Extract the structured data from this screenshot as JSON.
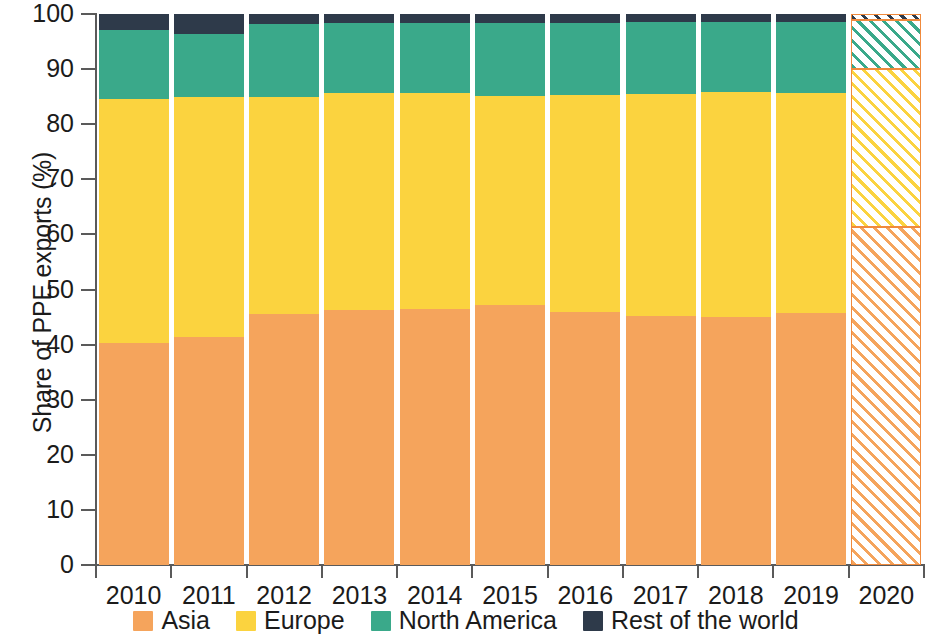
{
  "chart_data": {
    "type": "bar",
    "stacked": true,
    "title": "",
    "subtitle": "",
    "xlabel": "",
    "ylabel": "Share of PPE exports (%)",
    "ylim": [
      0,
      100
    ],
    "yticks": [
      0,
      10,
      20,
      30,
      40,
      50,
      60,
      70,
      80,
      90,
      100
    ],
    "ytick_labels": [
      "0",
      "10",
      "20",
      "30",
      "40",
      "50",
      "60",
      "70",
      "80",
      "90",
      "100"
    ],
    "grid": false,
    "legend_position": "bottom",
    "categories": [
      "2010",
      "2011",
      "2012",
      "2013",
      "2014",
      "2015",
      "2016",
      "2017",
      "2018",
      "2019",
      "2020"
    ],
    "hatched_categories": [
      "2020"
    ],
    "series": [
      {
        "name": "Asia",
        "color": "#f5a45c",
        "values": [
          40.3,
          41.3,
          45.6,
          46.2,
          46.4,
          47.2,
          46.0,
          45.2,
          45.0,
          45.8,
          61.4
        ]
      },
      {
        "name": "Europe",
        "color": "#fbd33f",
        "values": [
          44.3,
          43.6,
          39.3,
          39.4,
          39.3,
          38.0,
          39.3,
          40.2,
          40.9,
          39.9,
          28.7
        ]
      },
      {
        "name": "North America",
        "color": "#3aa98a",
        "values": [
          12.5,
          11.5,
          13.3,
          12.7,
          12.6,
          13.1,
          13.0,
          13.1,
          12.6,
          12.8,
          8.9
        ]
      },
      {
        "name": "Rest of the world",
        "color": "#2e3a4a",
        "values": [
          2.9,
          3.6,
          1.8,
          1.7,
          1.7,
          1.7,
          1.7,
          1.5,
          1.5,
          1.5,
          1.0
        ]
      }
    ],
    "annotations": []
  },
  "legend": {
    "items": [
      {
        "label": "Asia",
        "color": "#f5a45c"
      },
      {
        "label": "Europe",
        "color": "#fbd33f"
      },
      {
        "label": "North America",
        "color": "#3aa98a"
      },
      {
        "label": "Rest of the world",
        "color": "#2e3a4a"
      }
    ]
  },
  "axes": {
    "y_title": "Share of PPE exports (%)"
  }
}
